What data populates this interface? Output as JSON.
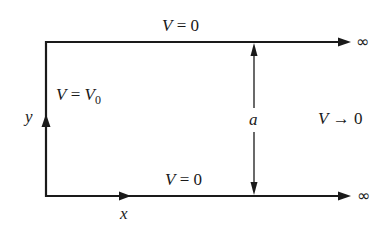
{
  "diagram": {
    "stroke_color": "#1a1a1a",
    "background": "#ffffff",
    "labels": {
      "top_boundary": {
        "var": "V",
        "eq": " = ",
        "val": "0"
      },
      "bottom_boundary": {
        "var": "V",
        "eq": " = ",
        "val": "0"
      },
      "left_boundary": {
        "var": "V",
        "eq": " = ",
        "val_var": "V",
        "val_sub": "0"
      },
      "far_field": {
        "var": "V",
        "arrow": " → ",
        "val": "0"
      },
      "width": "a",
      "x_axis": "x",
      "y_axis": "y",
      "top_infinity": "∞",
      "bottom_infinity": "∞"
    }
  }
}
